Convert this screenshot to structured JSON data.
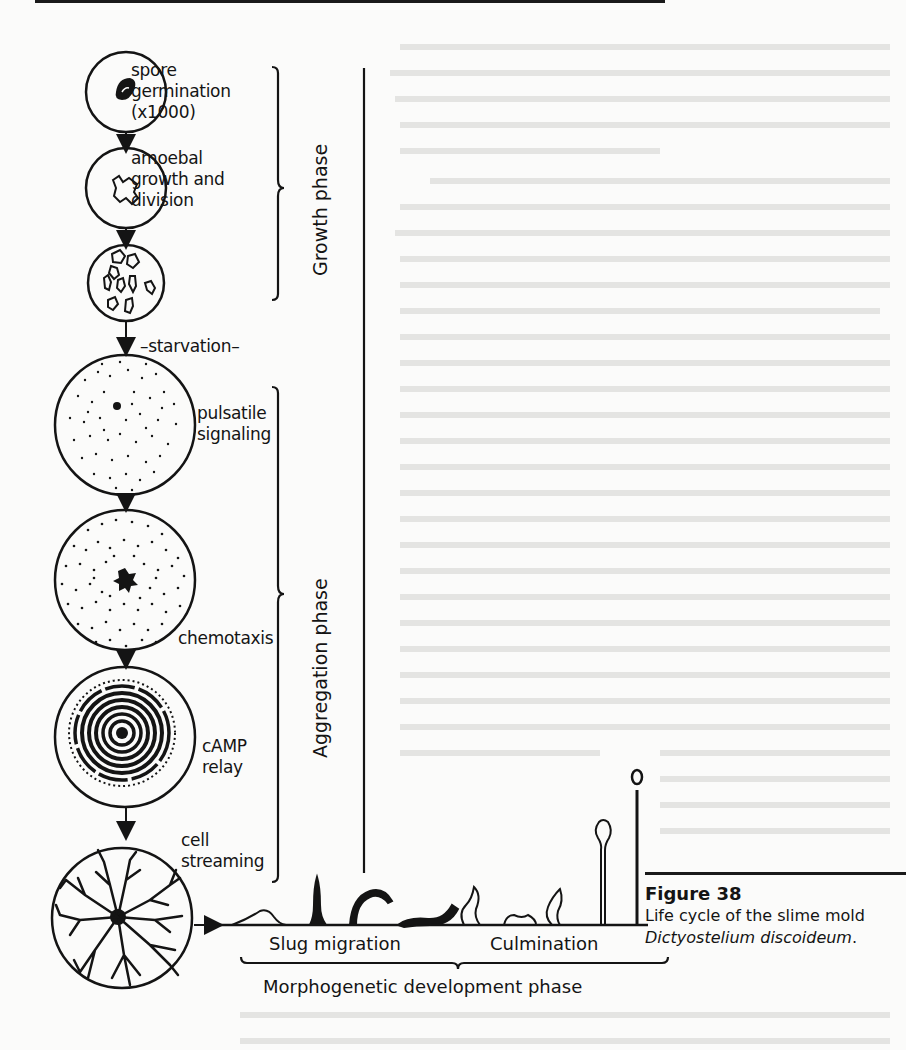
{
  "figure": {
    "number_label": "Figure 38",
    "caption_prefix": "Life cycle of the slime mold ",
    "caption_italic": "Dictyostelium discoideum",
    "caption_suffix": "."
  },
  "stages": [
    {
      "id": "spore-germination",
      "label": "spore\ngermination\n(x1000)"
    },
    {
      "id": "amoebal-growth",
      "label": "amoebal\ngrowth and\ndivision"
    },
    {
      "id": "amoebae-population",
      "label": ""
    },
    {
      "id": "pulsatile-signaling",
      "label": "pulsatile\nsignaling"
    },
    {
      "id": "chemotaxis",
      "label": "chemotaxis"
    },
    {
      "id": "camp-relay",
      "label": "cAMP\nrelay"
    },
    {
      "id": "cell-streaming",
      "label": "cell\nstreaming"
    }
  ],
  "transition_label": "–starvation–",
  "phases": {
    "growth": "Growth phase",
    "aggregation": "Aggregation phase",
    "morphogenetic": "Morphogenetic development phase"
  },
  "substages": {
    "slug_migration": "Slug migration",
    "culmination": "Culmination"
  },
  "colors": {
    "ink": "#141414",
    "paper": "#fbfbfa",
    "bleed_through": "#dcdcdc"
  }
}
